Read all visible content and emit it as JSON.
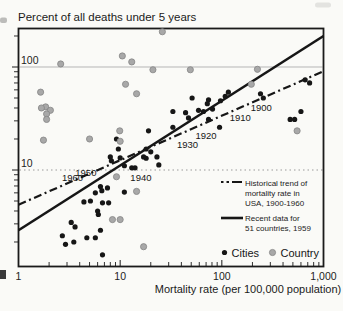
{
  "page": {
    "background": "#fafaf7"
  },
  "chart_data": {
    "type": "scatter",
    "title": "Percent of all deaths under 5 years",
    "xlabel": "Mortality rate (per 100,000 population)",
    "x_scale": "log",
    "y_scale": "log",
    "xlim": [
      1,
      1000
    ],
    "ylim": [
      1.15,
      225
    ],
    "x_ticks": [
      "1",
      "10",
      "100",
      "1,000"
    ],
    "x_tick_values": [
      1,
      10,
      100,
      1000
    ],
    "y_ticks": [
      "100",
      "10"
    ],
    "y_tick_values": [
      100,
      10
    ],
    "gridlines": [
      {
        "y": 100,
        "style": "solid"
      },
      {
        "y": 10,
        "style": "dotted"
      }
    ],
    "lines": [
      {
        "name": "historical",
        "style": "dashdot",
        "from": [
          1,
          4.6
        ],
        "to": [
          1000,
          91
        ]
      },
      {
        "name": "recent",
        "style": "solid",
        "from": [
          1,
          2.6
        ],
        "to": [
          1000,
          200
        ]
      }
    ],
    "year_markers": [
      {
        "label": "1900",
        "x": 244,
        "y": 40
      },
      {
        "label": "1910",
        "x": 152,
        "y": 32
      },
      {
        "label": "1920",
        "x": 70,
        "y": 21.4
      },
      {
        "label": "1930",
        "x": 46,
        "y": 17.5
      },
      {
        "label": "1940",
        "x": 16,
        "y": 8.4
      },
      {
        "label": "1950",
        "x": 4.6,
        "y": 9.4
      },
      {
        "label": "1960",
        "x": 3.4,
        "y": 8.4
      }
    ],
    "series": [
      {
        "name": "Cities",
        "marker": "dot",
        "color": "#161616",
        "points": [
          [
            51,
            50
          ],
          [
            74,
            48
          ],
          [
            72,
            44
          ],
          [
            59,
            38
          ],
          [
            66,
            37
          ],
          [
            81,
            39
          ],
          [
            44,
            36
          ],
          [
            33,
            37
          ],
          [
            47,
            32
          ],
          [
            74,
            31
          ],
          [
            95,
            26
          ],
          [
            33,
            26
          ],
          [
            19,
            24
          ],
          [
            17,
            13.4
          ],
          [
            108,
            52
          ],
          [
            116,
            57
          ],
          [
            97,
            47
          ],
          [
            240,
            55
          ],
          [
            256,
            50
          ],
          [
            600,
            37
          ],
          [
            470,
            31
          ],
          [
            520,
            31
          ],
          [
            660,
            75
          ],
          [
            730,
            70
          ],
          [
            20,
            15
          ],
          [
            23,
            13.4
          ],
          [
            24,
            11.2
          ],
          [
            13,
            10.5
          ],
          [
            11,
            11
          ],
          [
            14,
            10.5
          ],
          [
            18,
            16
          ],
          [
            18,
            13
          ],
          [
            9.2,
            20
          ],
          [
            9.6,
            16
          ],
          [
            8,
            13.4
          ],
          [
            8.2,
            12.3
          ],
          [
            10,
            13.1
          ],
          [
            6.4,
            6.9
          ],
          [
            7.5,
            6.7
          ],
          [
            5.7,
            6
          ],
          [
            6.6,
            6.3
          ],
          [
            11,
            6.1
          ],
          [
            4.4,
            4.9
          ],
          [
            5.1,
            5
          ],
          [
            6.7,
            4.8
          ],
          [
            7.7,
            4.8
          ],
          [
            6,
            4
          ],
          [
            6.1,
            3.7
          ],
          [
            3.3,
            3.1
          ],
          [
            3.6,
            2.8
          ],
          [
            2.7,
            2.3
          ],
          [
            3.5,
            2
          ],
          [
            5.7,
            2.2
          ],
          [
            4.7,
            2.2
          ],
          [
            2.9,
            1.9
          ],
          [
            6.4,
            2.6
          ],
          [
            6.7,
            1.5
          ]
        ]
      },
      {
        "name": "Country",
        "marker": "dot",
        "color": "#a8a8a8",
        "stroke": "#858585",
        "points": [
          [
            2.6,
            107
          ],
          [
            26,
            220
          ],
          [
            10.5,
            128
          ],
          [
            13,
            112
          ],
          [
            21,
            94
          ],
          [
            49,
            94
          ],
          [
            224,
            95
          ],
          [
            195,
            68
          ],
          [
            1.65,
            57
          ],
          [
            1.85,
            41
          ],
          [
            1.68,
            40
          ],
          [
            2.06,
            38
          ],
          [
            1.89,
            35
          ],
          [
            1.89,
            31
          ],
          [
            11.3,
            68
          ],
          [
            14.5,
            55
          ],
          [
            9.9,
            24
          ],
          [
            10,
            19
          ],
          [
            1.76,
            19.5
          ],
          [
            5,
            20
          ],
          [
            9.2,
            8.6
          ],
          [
            14.5,
            6.2
          ],
          [
            8.4,
            3.3
          ],
          [
            10,
            3.3
          ],
          [
            17,
            1.8
          ],
          [
            550,
            24
          ]
        ]
      }
    ],
    "legend": {
      "position": "inside-right",
      "historical_lines": [
        "Historical trend of",
        "mortality rate in",
        "USA, 1900-1960"
      ],
      "recent_lines": [
        "Recent data for",
        "51 countries, 1959"
      ],
      "cities_label": "Cities",
      "country_label": "Country"
    }
  }
}
